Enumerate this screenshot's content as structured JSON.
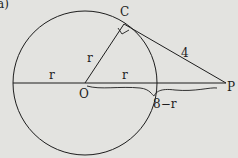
{
  "figure": {
    "part_label": "a)",
    "points": {
      "center": "O",
      "tangent_point": "C",
      "external_point": "P"
    },
    "labels": {
      "radius_oc": "r",
      "radius_left": "r",
      "radius_right": "r",
      "tangent_length": "4",
      "outside_segment": "8−r"
    },
    "colors": {
      "background": "#e3e3e0",
      "ink": "#1d1d1d"
    }
  }
}
